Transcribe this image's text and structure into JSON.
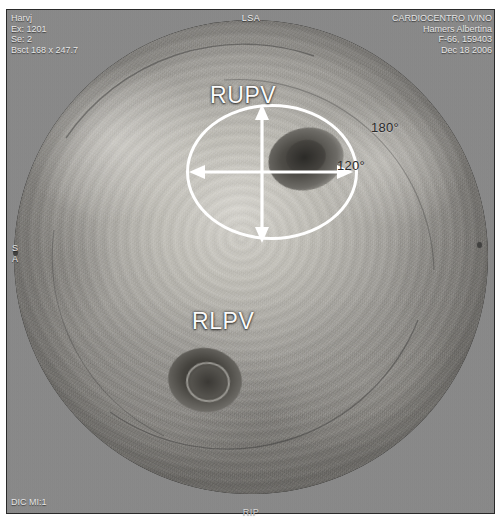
{
  "study": {
    "modality_label": "LSA",
    "bottom_center_label": "RIP",
    "top_left": {
      "line1": "Harvj",
      "line2": "Ex: 1201",
      "line3": "Se: 2",
      "line4": "Bsct 168 x 247.7"
    },
    "top_right": {
      "institution": "CARDIOCENTRO IVINO",
      "patient_name": "Hamers Albertina",
      "patient_id": "F-66, 159403",
      "study_date": "Dec 18 2006"
    },
    "bottom_left": {
      "line1": "DIC MI:1"
    },
    "left_edge": {
      "line1": "S",
      "line2": "A"
    }
  },
  "annotations": {
    "structures": [
      {
        "name": "RUPV",
        "label": "RUPV"
      },
      {
        "name": "RLPV",
        "label": "RLPV"
      }
    ],
    "angles": [
      {
        "name": "angle-180",
        "label": "180°"
      },
      {
        "name": "angle-120",
        "label": "120°"
      }
    ]
  },
  "colors": {
    "overlay_white": "#ffffff",
    "frame_gray": "#8a8a8a",
    "text_light": "#e6e6e6",
    "angle_text": "#2a2a2a"
  }
}
